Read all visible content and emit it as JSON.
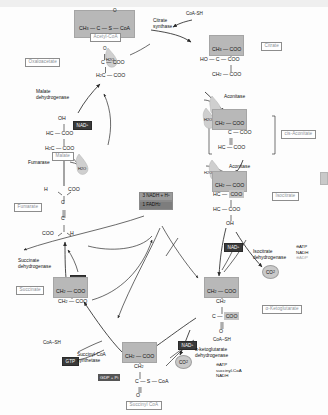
{
  "diagram": {
    "type": "biochemical-pathway"
  },
  "top_band": {
    "present": true
  },
  "compounds": {
    "acetyl_coa": {
      "name": "Acetyl-CoA",
      "formula_highlight": "CH3 — C — S — CoA",
      "ch3": "CH",
      "ch3_sub": "3",
      "carbonyl_o": "O",
      "c": "C",
      "s": "S",
      "coa": "CoA"
    },
    "oxaloacetate": {
      "name": "Oxaloacetate",
      "o": "O",
      "line1": "C — COO",
      "line2_h2c": "H",
      "line2_sub": "2",
      "line2_rest": "C — COO"
    },
    "citrate": {
      "name": "Citrate",
      "line1_hl": "CH",
      "line1_sub": "3",
      "line1_rest": " — COO",
      "line2": "HO — C — COO",
      "line3_ch2": "CH",
      "line3_sub": "2",
      "line3_rest": " — COO"
    },
    "cis_aconitate": {
      "name": "cis-Aconitate",
      "line1": "CH",
      "line1_sub": "2",
      "line1_rest": " — COO",
      "line2": "C — COO",
      "line3": "HC — COO"
    },
    "isocitrate": {
      "name": "Isocitrate",
      "line1": "CH",
      "line1_sub": "2",
      "line1_rest": " — COO",
      "line2_hc": "HC —",
      "line2_hl": "COO",
      "line3": "HC — COO",
      "line4": "OH"
    },
    "alpha_ketoglutarate": {
      "name": "α-Ketoglutarate",
      "line1": "CH",
      "line1_sub": "2",
      "line1_rest": " — COO",
      "line2": "CH",
      "line2_sub": "2",
      "line3_c": "C —",
      "line3_hl": "COO",
      "line4_o": "O"
    },
    "succinyl_coa": {
      "name": "Succinyl CoA",
      "line1": "CH",
      "line1_sub": "2",
      "line1_rest": " — COO",
      "line2": "CH",
      "line2_sub": "2",
      "line3": "C — S — CoA",
      "line4_o": "O"
    },
    "succinate": {
      "name": "Succinate",
      "line1": "CH",
      "line1_sub": "2",
      "line1_rest": " — COO",
      "line2": "CH",
      "line2_sub": "2",
      "line2_rest": " — COO"
    },
    "fumarate": {
      "name": "Fumarate",
      "h_top": "H",
      "coo_top": "COO",
      "c_top": "C",
      "c_bottom": "C",
      "coo_bottom": "COO",
      "h_bottom": "H"
    },
    "malate": {
      "name": "Malate",
      "oh": "OH",
      "line1": "HC — COO",
      "line2": "H",
      "line2_sub": "2",
      "line2_rest": "C — COO"
    }
  },
  "enzymes": {
    "citrate_synthase": "Citrate\nsynthase",
    "citrate_synthase_l1": "Citrate",
    "citrate_synthase_l2": "synthase",
    "aconitase_1": "Aconitase",
    "aconitase_2": "Aconitase",
    "isocitrate_dehydrogenase_l1": "Isocitrate",
    "isocitrate_dehydrogenase_l2": "dehydrogenase",
    "alpha_kg_dehydrogenase_l1": "α-ketoglutarate",
    "alpha_kg_dehydrogenase_l2": "dehydrogenase",
    "succinyl_coa_synthetase_l1": "Succinyl-CoA",
    "succinyl_coa_synthetase_l2": "synthetase",
    "succinate_dehydrogenase_l1": "Succinate",
    "succinate_dehydrogenase_l2": "dehydrogenase",
    "fumarase": "Fumarase",
    "malate_dehydrogenase_l1": "Malate",
    "malate_dehydrogenase_l2": "dehydrogenase"
  },
  "cofactors": {
    "coash_top": "CoA-SH",
    "coash_left": "CoA–SH",
    "coash_akg": "CoA–SH",
    "nad_malate": "NAD",
    "nad_isocitrate": "NAD",
    "nad_akg": "NAD",
    "nad_plus": "+",
    "fad": "FAD",
    "gtp": "GTP",
    "gdp_pi": "GDP + P",
    "gdp_pi_sub": "i",
    "water_1": "H",
    "water_1_sub": "2",
    "water_1_rest": "O",
    "water_2": "H",
    "water_3": "H",
    "water_4": "H",
    "co2_1": "CO",
    "co2_1_sub": "2",
    "co2_2": "CO",
    "co2_2_sub": "2"
  },
  "yield_box": {
    "line1": "3 NADH + H",
    "line1_sup": "+",
    "line2": "1 FADH",
    "line2_sub": "2"
  },
  "regulation": {
    "isocitrate_dh": [
      {
        "sign": "⊖",
        "molecule": "ATP",
        "active": true
      },
      {
        "sign": "",
        "molecule": "NADH",
        "active": true
      },
      {
        "sign": "⊕",
        "molecule": "ADP",
        "active": false
      }
    ],
    "alpha_kg_dh": [
      {
        "sign": "⊖",
        "molecule": "ATP",
        "active": true
      },
      {
        "sign": "",
        "molecule": "succinyl-CoA",
        "active": true
      },
      {
        "sign": "",
        "molecule": "NADH",
        "active": true
      }
    ],
    "isocitrate_dh_l1": "⊖ATP",
    "isocitrate_dh_l2": "NADH",
    "isocitrate_dh_l3": "⊕ADP",
    "akg_dh_l1": "⊖ATP",
    "akg_dh_l2": "succinyl-CoA",
    "akg_dh_l3": "NADH"
  },
  "colors": {
    "highlight_grey": "#b8b8b8",
    "chip_dark": "#3a3a3a",
    "name_box_text": "#8a8f96",
    "water_drop": "#cfcfcf",
    "co2_bubble": "#c9c9c9",
    "background": "#fdfdfd"
  }
}
